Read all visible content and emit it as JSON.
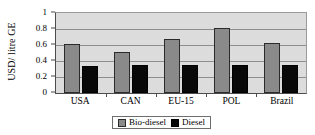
{
  "chart_data": {
    "type": "bar",
    "title": "",
    "xlabel": "",
    "ylabel": "USD/ litre GE",
    "categories": [
      "USA",
      "CAN",
      "EU-15",
      "POL",
      "Brazil"
    ],
    "series": [
      {
        "name": "Bio-diesel",
        "color": "#8a8a8a",
        "values": [
          0.61,
          0.51,
          0.675,
          0.81,
          0.63
        ]
      },
      {
        "name": "Diesel",
        "color": "#080808",
        "values": [
          0.335,
          0.355,
          0.355,
          0.345,
          0.345
        ]
      }
    ],
    "ylim": [
      0,
      1
    ],
    "yticks": [
      "0",
      "0.2",
      "0.4",
      "0.6",
      "0.8",
      "1"
    ],
    "ytick_values": [
      0,
      0.2,
      0.4,
      0.6,
      0.8,
      1
    ],
    "grid": true,
    "legend_position": "bottom",
    "plot_background": "#dcdcdc",
    "figure_background": "#ffffff"
  },
  "legend": {
    "entries": [
      {
        "label": "Bio-diesel"
      },
      {
        "label": "Diesel"
      }
    ]
  }
}
